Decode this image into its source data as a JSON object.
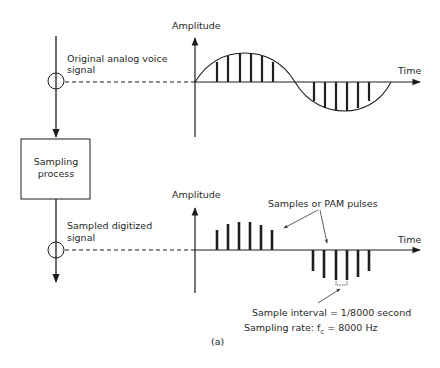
{
  "diagram": {
    "caption": "(a)",
    "left_flow": {
      "input_label_line1": "Original analog voice",
      "input_label_line2": "signal",
      "process_box_line1": "Sampling",
      "process_box_line2": "process",
      "output_label_line1": "Sampled digitized",
      "output_label_line2": "signal"
    },
    "top_plot": {
      "y_axis_label": "Amplitude",
      "x_axis_label": "Time",
      "description": "Analog sine wave with vertical sample lines",
      "positive_sample_count": 6,
      "negative_sample_count": 6
    },
    "bottom_plot": {
      "y_axis_label": "Amplitude",
      "x_axis_label": "Time",
      "callout_pulses": "Samples or PAM pulses",
      "interval_label": "Sample interval = 1/8000 second",
      "rate_label_prefix": "Sampling rate: f",
      "rate_label_subscript": "c",
      "rate_label_suffix": " = 8000 Hz",
      "positive_pulse_count": 6,
      "negative_pulse_count": 6
    },
    "colors": {
      "line": "#1e1e1e",
      "text": "#2a2a2a",
      "background": "#ffffff"
    }
  }
}
